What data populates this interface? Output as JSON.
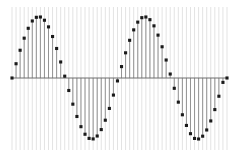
{
  "figure": {
    "name": "discrete-sine-stem-plot",
    "width": 244,
    "height": 157,
    "background": "#ffffff"
  },
  "style": {
    "gridline_color": "#e3e3e3",
    "gridline_width": 1.0,
    "stem_color": "#8a8a8a",
    "stem_width": 0.9,
    "marker_color": "#1a1a1a",
    "marker_size": 3.1,
    "marker_shape": "square",
    "baseline_color": "#6e6e6e",
    "baseline_width": 1.0
  },
  "geometry": {
    "x_left_px": 12,
    "x_right_px": 227,
    "baseline_y_px": 78,
    "amplitude_px": 61,
    "grid_top_px": 7,
    "grid_bottom_px": 150,
    "sample_count": 54,
    "sample_step_px": 4.057,
    "period_px": 106,
    "cycles": 2.0
  },
  "chart_data": {
    "type": "line",
    "subtype": "stem",
    "title": "",
    "subtitle": "",
    "xlabel": "",
    "ylabel": "",
    "xlim": [
      0,
      53
    ],
    "ylim": [
      -1,
      1
    ],
    "grid": "vertical-only",
    "legend": "none",
    "annotations": [],
    "tick_labels_x": [],
    "tick_labels_y": [],
    "x": [
      0,
      1,
      2,
      3,
      4,
      5,
      6,
      7,
      8,
      9,
      10,
      11,
      12,
      13,
      14,
      15,
      16,
      17,
      18,
      19,
      20,
      21,
      22,
      23,
      24,
      25,
      26,
      27,
      28,
      29,
      30,
      31,
      32,
      33,
      34,
      35,
      36,
      37,
      38,
      39,
      40,
      41,
      42,
      43,
      44,
      45,
      46,
      47,
      48,
      49,
      50,
      51,
      52,
      53
    ],
    "series": [
      {
        "name": "sin(2πx/26.5)",
        "values": [
          0.0,
          0.234,
          0.455,
          0.653,
          0.815,
          0.935,
          0.995,
          1.0,
          0.947,
          0.838,
          0.68,
          0.484,
          0.263,
          0.03,
          -0.205,
          -0.429,
          -0.631,
          -0.798,
          -0.922,
          -0.99,
          -0.999,
          -0.951,
          -0.846,
          -0.692,
          -0.499,
          -0.28,
          -0.048,
          0.187,
          0.413,
          0.618,
          0.789,
          0.916,
          0.989,
          1.0,
          0.956,
          0.855,
          0.703,
          0.512,
          0.295,
          0.065,
          -0.169,
          -0.396,
          -0.603,
          -0.778,
          -0.913,
          -0.991,
          -1.0,
          -0.954,
          -0.852,
          -0.704,
          -0.518,
          -0.299,
          -0.072,
          0.0
        ]
      }
    ]
  }
}
